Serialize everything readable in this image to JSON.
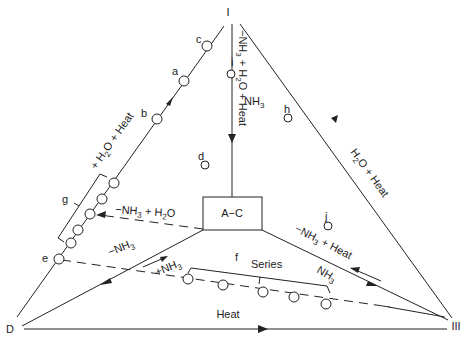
{
  "diagram": {
    "type": "ternary-reaction-diagram",
    "vertices": {
      "top": "I",
      "bottom_left": "D",
      "bottom_right": "III"
    },
    "center_box": {
      "label": "A−C"
    },
    "points": {
      "a": "a",
      "b": "b",
      "c": "c",
      "d": "d",
      "e": "e",
      "f": "f",
      "g": "g",
      "h": "h",
      "i": "i",
      "j": "j"
    },
    "edge_labels": {
      "left_edge": {
        "prefix": "+ H",
        "sub": "2",
        "suffix": "O + Heat"
      },
      "right_edge": {
        "prefix": "H",
        "sub": "2",
        "suffix": "O + Heat"
      },
      "bottom_edge": "Heat",
      "center_vertical": {
        "p1": "−NH",
        "s1": "3",
        "p2": " + H",
        "s2": "2",
        "p3": "O + Heat"
      }
    },
    "arrow_labels": {
      "box_to_g": {
        "p1": "−NH",
        "s1": "3",
        "p2": " + H",
        "s2": "2",
        "p3": "O"
      },
      "box_to_D": {
        "p1": "−NH",
        "s1": "3"
      },
      "D_to_series": {
        "p1": "+NH",
        "s1": "3"
      },
      "box_to_III": {
        "p1": "−NH",
        "s1": "3",
        "p2": " + Heat"
      },
      "III_to_series": {
        "p1": "NH",
        "s1": "3"
      },
      "i_region": {
        "p1": "NH",
        "s1": "3"
      }
    },
    "series_label": "Series",
    "colors": {
      "ink": "#222222",
      "background": "#ffffff"
    }
  }
}
